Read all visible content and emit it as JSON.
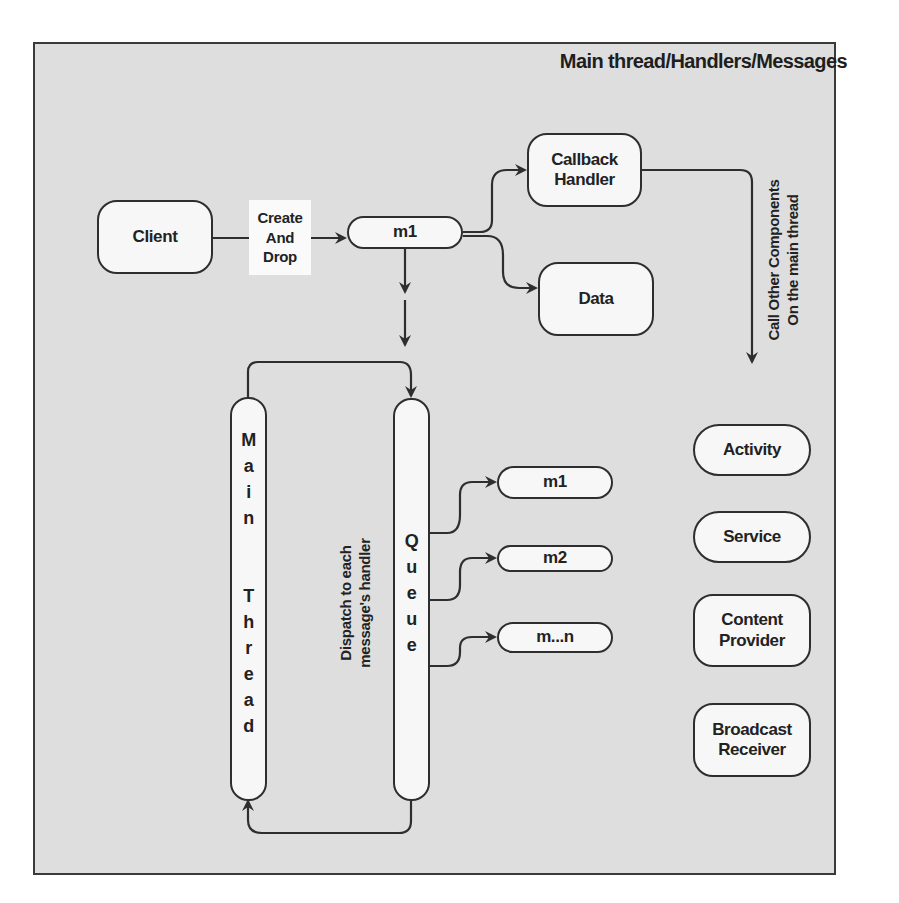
{
  "title": "Main thread/Handlers/Messages",
  "nodes": {
    "client": "Client",
    "create_and_drop": "Create\nAnd\nDrop",
    "m1_top": "m1",
    "callback_handler": "Callback\nHandler",
    "data": "Data",
    "main_thread_letters": [
      "M",
      "a",
      "i",
      "n",
      "",
      "T",
      "h",
      "r",
      "e",
      "a",
      "d"
    ],
    "queue_letters": [
      "Q",
      "u",
      "e",
      "u",
      "e"
    ],
    "queue_messages": [
      "m1",
      "m2",
      "m...n"
    ],
    "components": [
      "Activity",
      "Service",
      "Content\nProvider",
      "Broadcast\nReceiver"
    ]
  },
  "labels": {
    "call_other_components": "Call Other Components\nOn the main thread",
    "dispatch": "Dispatch to each\nmessage's handler"
  },
  "colors": {
    "background": "#dedede",
    "node_fill": "#f7f7f7",
    "stroke": "#2e2e2e"
  }
}
